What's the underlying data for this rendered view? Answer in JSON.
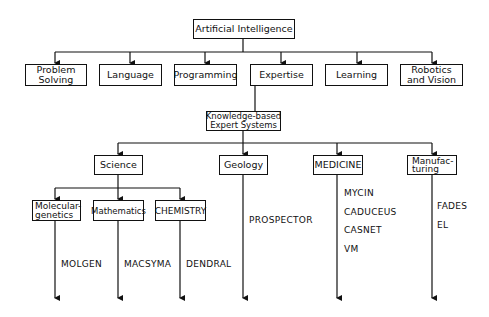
{
  "root": {
    "label": "Artificial Intelligence"
  },
  "level1": [
    {
      "label": "Problem\nSolving"
    },
    {
      "label": "Language"
    },
    {
      "label": "Programming"
    },
    {
      "label": "Expertise"
    },
    {
      "label": "Learning"
    },
    {
      "label": "Robotics\nand Vision"
    }
  ],
  "kbes": {
    "label": "Knowledge-based\nExpert Systems"
  },
  "domains": [
    {
      "label": "Science"
    },
    {
      "label": "Geology"
    },
    {
      "label": "MEDICINE"
    },
    {
      "label": "Manufac-\nturing"
    }
  ],
  "science_sub": [
    {
      "label": "Molecular-\ngenetics"
    },
    {
      "label": "Mathematics"
    },
    {
      "label": "CHEMISTRY"
    }
  ],
  "systems": {
    "molecular_genetics": "MOLGEN",
    "mathematics": "MACSYMA",
    "chemistry": "DENDRAL",
    "geology": "PROSPECTOR",
    "medicine": "MYCIN\nCADUCEUS\nCASNET\nVM",
    "manufacturing": "FADES\nEL"
  },
  "colors": {
    "line": "#111111",
    "background": "#ffffff"
  }
}
